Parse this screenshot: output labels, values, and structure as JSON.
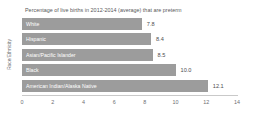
{
  "chart_data": {
    "type": "bar",
    "orientation": "horizontal",
    "title": "Percentage of live births in 2012-2014 (average) that are preterm",
    "xlabel": "",
    "ylabel": "Race/Ethnicity",
    "categories": [
      "White",
      "Hispanic",
      "Asian/Pacific Islander",
      "Black",
      "American Indian/Alaska Native"
    ],
    "values": [
      7.8,
      8.4,
      8.5,
      10.0,
      12.1
    ],
    "value_labels": [
      "7.8",
      "8.4",
      "8.5",
      "10.0",
      "12.1"
    ],
    "xlim": [
      0,
      14
    ],
    "xticks": [
      0,
      2,
      4,
      6,
      8,
      10,
      12,
      14
    ],
    "xtick_labels": [
      "0",
      "2",
      "4",
      "6",
      "8",
      "10",
      "12",
      "14"
    ],
    "grid": false,
    "legend": null,
    "bar_color": "#9c9c9c",
    "background_color": "#ffffff",
    "title_color": "#58585a",
    "axis_text_color": "#6d6e71",
    "value_label_color": "#4d4d4f",
    "category_label_color": "#ffffff"
  }
}
